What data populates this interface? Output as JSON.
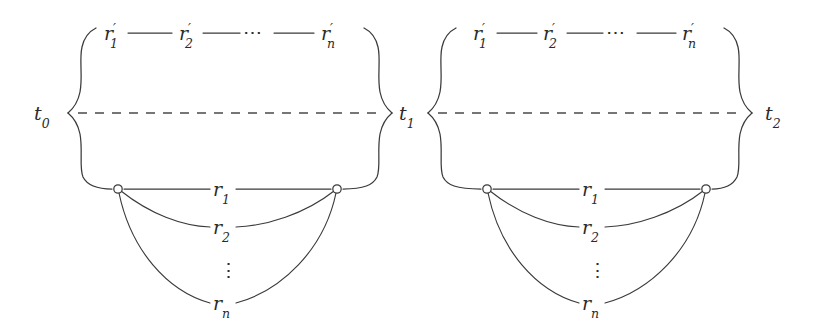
{
  "figure": {
    "kind": "mathematical-diagram",
    "background_color": "#ffffff",
    "ink_color": "#3a3a3a",
    "text_color": "#2b2b2b"
  },
  "vertices": [
    {
      "id": "t0",
      "base": "t",
      "sub": "0",
      "x": 44,
      "y": 113
    },
    {
      "id": "t1",
      "base": "t",
      "sub": "1",
      "x": 400,
      "y": 113
    },
    {
      "id": "t2",
      "base": "t",
      "sub": "2",
      "x": 768,
      "y": 113
    }
  ],
  "cells": [
    {
      "name": "cell-left",
      "left_vertex": "t0",
      "right_vertex": "t1",
      "top_path": {
        "nodes": [
          {
            "base": "r",
            "prime": true,
            "sub": "1",
            "x": 112,
            "y": 35
          },
          {
            "base": "r",
            "prime": true,
            "sub": "2",
            "x": 187,
            "y": 35
          },
          {
            "ellipsis": true,
            "glyph": "⋯",
            "x": 250,
            "y": 35
          },
          {
            "base": "r",
            "prime": true,
            "sub": "n",
            "x": 330,
            "y": 35
          }
        ],
        "connector": "line-segment"
      },
      "middle": {
        "style": "dashed",
        "y": 113
      },
      "bottom_fan": {
        "left_node": {
          "shape": "circle",
          "filled": false,
          "x": 118,
          "y": 189
        },
        "right_node": {
          "shape": "circle",
          "filled": false,
          "x": 337,
          "y": 189
        },
        "rows": [
          {
            "base": "r",
            "sub": "1",
            "x": 222,
            "y": 189,
            "curvature": 0
          },
          {
            "base": "r",
            "sub": "2",
            "x": 222,
            "y": 227,
            "curvature": 1
          },
          {
            "ellipsis": true,
            "glyph": "⋮",
            "x": 222,
            "y": 270
          },
          {
            "base": "r",
            "sub": "n",
            "x": 222,
            "y": 303,
            "curvature": 2
          }
        ]
      }
    },
    {
      "name": "cell-right",
      "left_vertex": "t1",
      "right_vertex": "t2",
      "top_path": {
        "nodes": [
          {
            "base": "r",
            "prime": true,
            "sub": "1",
            "x": 481,
            "y": 35
          },
          {
            "base": "r",
            "prime": true,
            "sub": "2",
            "x": 551,
            "y": 35
          },
          {
            "ellipsis": true,
            "glyph": "⋯",
            "x": 613,
            "y": 35
          },
          {
            "base": "r",
            "prime": true,
            "sub": "n",
            "x": 691,
            "y": 35
          }
        ],
        "connector": "line-segment"
      },
      "middle": {
        "style": "dashed",
        "y": 113
      },
      "bottom_fan": {
        "left_node": {
          "shape": "circle",
          "filled": false,
          "x": 487,
          "y": 189
        },
        "right_node": {
          "shape": "circle",
          "filled": false,
          "x": 706,
          "y": 189
        },
        "rows": [
          {
            "base": "r",
            "sub": "1",
            "x": 591,
            "y": 189,
            "curvature": 0
          },
          {
            "base": "r",
            "sub": "2",
            "x": 591,
            "y": 227,
            "curvature": 1
          },
          {
            "ellipsis": true,
            "glyph": "⋮",
            "x": 591,
            "y": 270
          },
          {
            "base": "r",
            "sub": "n",
            "x": 591,
            "y": 303,
            "curvature": 2
          }
        ]
      }
    }
  ],
  "labels": {
    "t0": "t",
    "t0_sub": "0",
    "t1": "t",
    "t1_sub": "1",
    "t2": "t",
    "t2_sub": "2",
    "r_base": "r",
    "prime_mark": "′",
    "sub_1": "1",
    "sub_2": "2",
    "sub_n": "n",
    "hdots": "⋯",
    "vdots": "⋮"
  }
}
